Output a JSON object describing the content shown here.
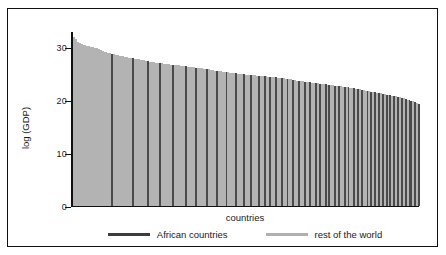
{
  "chart_data": {
    "type": "bar",
    "title": "",
    "xlabel": "countries",
    "ylabel": "log (GDP)",
    "ylim": [
      0,
      33
    ],
    "yticks": [
      0,
      10,
      20,
      30
    ],
    "ytick_labels": [
      "0",
      "10",
      "20",
      "30"
    ],
    "grid": false,
    "legend_position": "below-axis",
    "series": [
      {
        "name": "African countries",
        "color": "#4a4a4a"
      },
      {
        "name": "rest of the world",
        "color": "#b3b3b3"
      }
    ],
    "legend": [
      {
        "label": "African countries",
        "color": "#3d3d3d"
      },
      {
        "label": "rest of the world",
        "color": "#b0b0b0"
      }
    ],
    "bars": [
      {
        "v": 32.0,
        "g": 1
      },
      {
        "v": 31.6,
        "g": 1
      },
      {
        "v": 31.2,
        "g": 1
      },
      {
        "v": 30.9,
        "g": 1
      },
      {
        "v": 30.7,
        "g": 1
      },
      {
        "v": 30.6,
        "g": 1
      },
      {
        "v": 30.5,
        "g": 1
      },
      {
        "v": 30.4,
        "g": 1
      },
      {
        "v": 30.3,
        "g": 1
      },
      {
        "v": 30.2,
        "g": 1
      },
      {
        "v": 30.1,
        "g": 1
      },
      {
        "v": 30.0,
        "g": 1
      },
      {
        "v": 29.9,
        "g": 1
      },
      {
        "v": 29.8,
        "g": 1
      },
      {
        "v": 29.6,
        "g": 1
      },
      {
        "v": 29.4,
        "g": 1
      },
      {
        "v": 29.3,
        "g": 1
      },
      {
        "v": 29.2,
        "g": 1
      },
      {
        "v": 29.1,
        "g": 1
      },
      {
        "v": 29.0,
        "g": 1
      },
      {
        "v": 28.9,
        "g": 0
      },
      {
        "v": 28.8,
        "g": 1
      },
      {
        "v": 28.7,
        "g": 1
      },
      {
        "v": 28.6,
        "g": 1
      },
      {
        "v": 28.5,
        "g": 1
      },
      {
        "v": 28.4,
        "g": 1
      },
      {
        "v": 28.4,
        "g": 1
      },
      {
        "v": 28.3,
        "g": 1
      },
      {
        "v": 28.2,
        "g": 1
      },
      {
        "v": 28.1,
        "g": 1
      },
      {
        "v": 28.0,
        "g": 1
      },
      {
        "v": 28.0,
        "g": 0
      },
      {
        "v": 27.9,
        "g": 1
      },
      {
        "v": 27.8,
        "g": 1
      },
      {
        "v": 27.8,
        "g": 1
      },
      {
        "v": 27.7,
        "g": 1
      },
      {
        "v": 27.6,
        "g": 1
      },
      {
        "v": 27.6,
        "g": 1
      },
      {
        "v": 27.5,
        "g": 1
      },
      {
        "v": 27.5,
        "g": 0
      },
      {
        "v": 27.4,
        "g": 1
      },
      {
        "v": 27.3,
        "g": 1
      },
      {
        "v": 27.3,
        "g": 1
      },
      {
        "v": 27.2,
        "g": 1
      },
      {
        "v": 27.2,
        "g": 1
      },
      {
        "v": 27.1,
        "g": 0
      },
      {
        "v": 27.1,
        "g": 1
      },
      {
        "v": 27.0,
        "g": 1
      },
      {
        "v": 27.0,
        "g": 1
      },
      {
        "v": 26.9,
        "g": 1
      },
      {
        "v": 26.9,
        "g": 1
      },
      {
        "v": 26.8,
        "g": 1
      },
      {
        "v": 26.8,
        "g": 0
      },
      {
        "v": 26.8,
        "g": 1
      },
      {
        "v": 26.7,
        "g": 1
      },
      {
        "v": 26.7,
        "g": 1
      },
      {
        "v": 26.6,
        "g": 1
      },
      {
        "v": 26.6,
        "g": 1
      },
      {
        "v": 26.5,
        "g": 1
      },
      {
        "v": 26.5,
        "g": 0
      },
      {
        "v": 26.4,
        "g": 1
      },
      {
        "v": 26.4,
        "g": 1
      },
      {
        "v": 26.3,
        "g": 1
      },
      {
        "v": 26.3,
        "g": 1
      },
      {
        "v": 26.2,
        "g": 0
      },
      {
        "v": 26.2,
        "g": 1
      },
      {
        "v": 26.1,
        "g": 1
      },
      {
        "v": 26.1,
        "g": 1
      },
      {
        "v": 26.0,
        "g": 1
      },
      {
        "v": 26.0,
        "g": 1
      },
      {
        "v": 25.9,
        "g": 0
      },
      {
        "v": 25.9,
        "g": 1
      },
      {
        "v": 25.8,
        "g": 1
      },
      {
        "v": 25.8,
        "g": 1
      },
      {
        "v": 25.7,
        "g": 1
      },
      {
        "v": 25.7,
        "g": 0
      },
      {
        "v": 25.6,
        "g": 1
      },
      {
        "v": 25.6,
        "g": 1
      },
      {
        "v": 25.5,
        "g": 1
      },
      {
        "v": 25.5,
        "g": 1
      },
      {
        "v": 25.4,
        "g": 0
      },
      {
        "v": 25.4,
        "g": 1
      },
      {
        "v": 25.3,
        "g": 1
      },
      {
        "v": 25.3,
        "g": 1
      },
      {
        "v": 25.2,
        "g": 1
      },
      {
        "v": 25.2,
        "g": 0
      },
      {
        "v": 25.1,
        "g": 1
      },
      {
        "v": 25.1,
        "g": 1
      },
      {
        "v": 25.0,
        "g": 1
      },
      {
        "v": 25.0,
        "g": 0
      },
      {
        "v": 24.9,
        "g": 1
      },
      {
        "v": 24.9,
        "g": 1
      },
      {
        "v": 24.9,
        "g": 1
      },
      {
        "v": 24.8,
        "g": 0
      },
      {
        "v": 24.8,
        "g": 1
      },
      {
        "v": 24.8,
        "g": 1
      },
      {
        "v": 24.7,
        "g": 1
      },
      {
        "v": 24.7,
        "g": 0
      },
      {
        "v": 24.7,
        "g": 1
      },
      {
        "v": 24.6,
        "g": 1
      },
      {
        "v": 24.6,
        "g": 0
      },
      {
        "v": 24.6,
        "g": 1
      },
      {
        "v": 24.5,
        "g": 1
      },
      {
        "v": 24.5,
        "g": 0
      },
      {
        "v": 24.5,
        "g": 1
      },
      {
        "v": 24.4,
        "g": 1
      },
      {
        "v": 24.4,
        "g": 0
      },
      {
        "v": 24.3,
        "g": 1
      },
      {
        "v": 24.3,
        "g": 1
      },
      {
        "v": 24.2,
        "g": 0
      },
      {
        "v": 24.2,
        "g": 1
      },
      {
        "v": 24.1,
        "g": 1
      },
      {
        "v": 24.1,
        "g": 0
      },
      {
        "v": 24.0,
        "g": 1
      },
      {
        "v": 24.0,
        "g": 1
      },
      {
        "v": 23.9,
        "g": 0
      },
      {
        "v": 23.9,
        "g": 1
      },
      {
        "v": 23.8,
        "g": 1
      },
      {
        "v": 23.8,
        "g": 0
      },
      {
        "v": 23.7,
        "g": 1
      },
      {
        "v": 23.7,
        "g": 1
      },
      {
        "v": 23.6,
        "g": 0
      },
      {
        "v": 23.6,
        "g": 1
      },
      {
        "v": 23.5,
        "g": 1
      },
      {
        "v": 23.5,
        "g": 0
      },
      {
        "v": 23.4,
        "g": 1
      },
      {
        "v": 23.4,
        "g": 1
      },
      {
        "v": 23.3,
        "g": 0
      },
      {
        "v": 23.3,
        "g": 1
      },
      {
        "v": 23.2,
        "g": 0
      },
      {
        "v": 23.2,
        "g": 1
      },
      {
        "v": 23.1,
        "g": 1
      },
      {
        "v": 23.1,
        "g": 0
      },
      {
        "v": 23.0,
        "g": 1
      },
      {
        "v": 23.0,
        "g": 0
      },
      {
        "v": 22.9,
        "g": 1
      },
      {
        "v": 22.9,
        "g": 1
      },
      {
        "v": 22.8,
        "g": 0
      },
      {
        "v": 22.8,
        "g": 1
      },
      {
        "v": 22.7,
        "g": 0
      },
      {
        "v": 22.7,
        "g": 1
      },
      {
        "v": 22.6,
        "g": 1
      },
      {
        "v": 22.6,
        "g": 0
      },
      {
        "v": 22.5,
        "g": 1
      },
      {
        "v": 22.5,
        "g": 0
      },
      {
        "v": 22.4,
        "g": 1
      },
      {
        "v": 22.3,
        "g": 1
      },
      {
        "v": 22.3,
        "g": 0
      },
      {
        "v": 22.2,
        "g": 1
      },
      {
        "v": 22.1,
        "g": 0
      },
      {
        "v": 22.1,
        "g": 1
      },
      {
        "v": 22.0,
        "g": 0
      },
      {
        "v": 22.0,
        "g": 1
      },
      {
        "v": 21.9,
        "g": 1
      },
      {
        "v": 21.8,
        "g": 0
      },
      {
        "v": 21.8,
        "g": 1
      },
      {
        "v": 21.7,
        "g": 0
      },
      {
        "v": 21.6,
        "g": 1
      },
      {
        "v": 21.6,
        "g": 0
      },
      {
        "v": 21.5,
        "g": 1
      },
      {
        "v": 21.4,
        "g": 0
      },
      {
        "v": 21.4,
        "g": 1
      },
      {
        "v": 21.3,
        "g": 0
      },
      {
        "v": 21.2,
        "g": 1
      },
      {
        "v": 21.1,
        "g": 0
      },
      {
        "v": 21.1,
        "g": 1
      },
      {
        "v": 21.0,
        "g": 0
      },
      {
        "v": 20.9,
        "g": 1
      },
      {
        "v": 20.8,
        "g": 0
      },
      {
        "v": 20.8,
        "g": 1
      },
      {
        "v": 20.7,
        "g": 0
      },
      {
        "v": 20.6,
        "g": 1
      },
      {
        "v": 20.5,
        "g": 0
      },
      {
        "v": 20.4,
        "g": 1
      },
      {
        "v": 20.3,
        "g": 0
      },
      {
        "v": 20.2,
        "g": 1
      },
      {
        "v": 20.1,
        "g": 0
      },
      {
        "v": 20.0,
        "g": 0
      },
      {
        "v": 19.9,
        "g": 1
      },
      {
        "v": 19.7,
        "g": 0
      },
      {
        "v": 19.5,
        "g": 1
      },
      {
        "v": 19.3,
        "g": 0
      }
    ]
  }
}
